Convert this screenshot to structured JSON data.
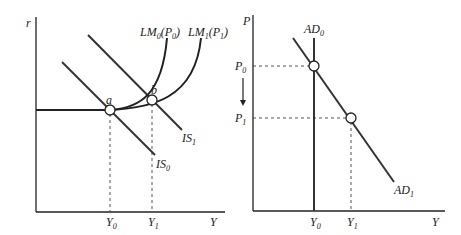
{
  "colors": {
    "line": "#333333",
    "axis": "#222222",
    "background": "#ffffff"
  },
  "left_panel": {
    "y_axis_label": "r",
    "x_axis_label": "Y",
    "curves": {
      "lm0": {
        "base": "LM",
        "sub": "0",
        "arg_base": "P",
        "arg_sub": "0"
      },
      "lm1": {
        "base": "LM",
        "sub": "1",
        "arg_base": "P",
        "arg_sub": "1"
      },
      "is0": {
        "base": "IS",
        "sub": "0"
      },
      "is1": {
        "base": "IS",
        "sub": "1"
      }
    },
    "points": {
      "a": "a",
      "b": "b"
    },
    "x_ticks": [
      {
        "base": "Y",
        "sub": "0"
      },
      {
        "base": "Y",
        "sub": "1"
      }
    ]
  },
  "right_panel": {
    "y_axis_label": "P",
    "x_axis_label": "Y",
    "curves": {
      "ad0": {
        "base": "AD",
        "sub": "0"
      },
      "ad1": {
        "base": "AD",
        "sub": "1"
      }
    },
    "y_ticks": [
      {
        "base": "P",
        "sub": "0"
      },
      {
        "base": "P",
        "sub": "1"
      }
    ],
    "x_ticks": [
      {
        "base": "Y",
        "sub": "0"
      },
      {
        "base": "Y",
        "sub": "1"
      }
    ],
    "arrow": "down-arrow"
  }
}
